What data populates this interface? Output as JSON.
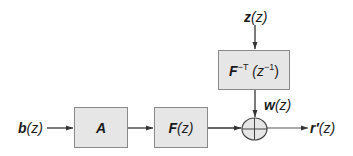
{
  "diagram": {
    "type": "block-diagram",
    "colors": {
      "block_fill": "#e6e6e6",
      "block_border": "#8a8a8a",
      "line": "#333333",
      "text": "#1a1a1a"
    },
    "inputs": {
      "b": {
        "symbol": "b",
        "arg": "(z)"
      },
      "z": {
        "symbol": "z",
        "arg": "(z)"
      }
    },
    "blocks": {
      "A": {
        "symbol": "A"
      },
      "F": {
        "symbol": "F",
        "arg": "(z)"
      },
      "Finv": {
        "symbol": "F",
        "sup": "−T",
        "arg_open": " (z",
        "arg_sup": "−1",
        "arg_close": ")"
      }
    },
    "signals": {
      "w": {
        "symbol": "w",
        "arg": "(z)"
      }
    },
    "summer": {
      "symbol": "plus-circle"
    },
    "output": {
      "symbol": "r′",
      "arg": "(z)"
    }
  }
}
